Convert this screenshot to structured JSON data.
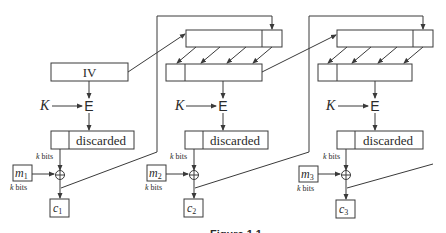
{
  "diagram": {
    "type": "cipher-feedback-mode",
    "iv_label": "IV",
    "key_label": "K",
    "encrypt_label": "E",
    "discarded_label": "discarded",
    "k_bits_label": "k bits",
    "xor_symbol": "⊕",
    "stages": [
      {
        "plaintext": "m",
        "plaintext_sub": "1",
        "ciphertext": "c",
        "ciphertext_sub": "1"
      },
      {
        "plaintext": "m",
        "plaintext_sub": "2",
        "ciphertext": "c",
        "ciphertext_sub": "2"
      },
      {
        "plaintext": "m",
        "plaintext_sub": "3",
        "ciphertext": "c",
        "ciphertext_sub": "3"
      }
    ],
    "caption": "Figure 1.1"
  }
}
